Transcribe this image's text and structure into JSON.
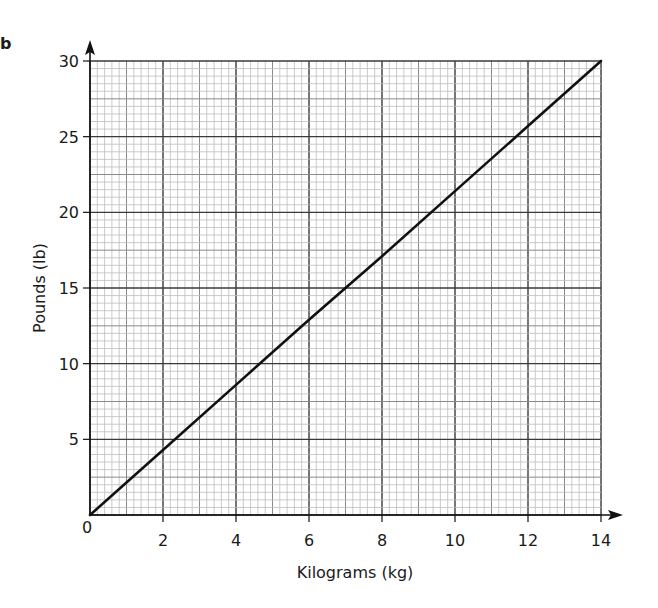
{
  "part_label": "b",
  "chart_data": {
    "type": "line",
    "title": "",
    "xlabel": "Kilograms (kg)",
    "ylabel": "Pounds (lb)",
    "xlim": [
      0,
      14
    ],
    "ylim": [
      0,
      30
    ],
    "x_ticks": [
      0,
      2,
      4,
      6,
      8,
      10,
      12,
      14
    ],
    "y_ticks": [
      5,
      10,
      15,
      20,
      25,
      30
    ],
    "origin_label": "0",
    "grid": true,
    "grid_minor_x_step": 0.2,
    "grid_minor_y_step": 0.5,
    "grid_major_x_step": 2,
    "grid_major_y_step": 5,
    "series": [
      {
        "name": "kg to lb conversion",
        "x": [
          0,
          2,
          4,
          6,
          8,
          10,
          12,
          14
        ],
        "y": [
          0,
          4.3,
          8.6,
          12.9,
          17.1,
          21.4,
          25.7,
          30
        ],
        "color": "#111111"
      }
    ],
    "legend": null
  },
  "colors": {
    "major_grid": "#3a3a3a",
    "mid_grid": "#8a8a8a",
    "minor_grid": "#bdbdbd",
    "axis": "#111111",
    "line": "#111111"
  }
}
